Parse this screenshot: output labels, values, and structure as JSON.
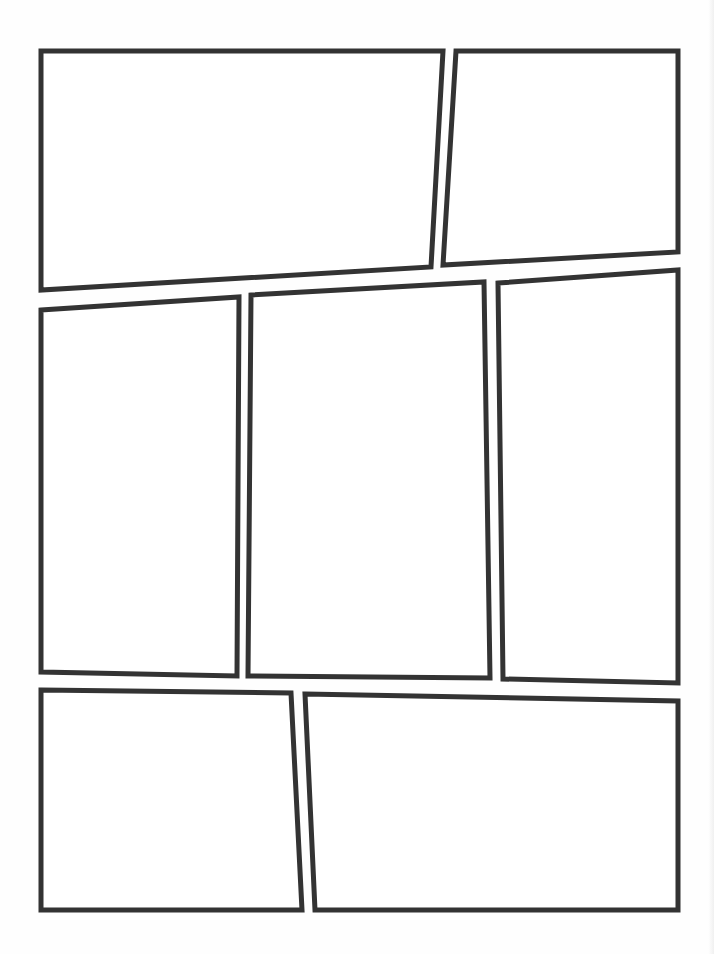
{
  "page": {
    "type": "comic-panel-layout-template",
    "background": "#ffffff",
    "border_color": "#333333",
    "border_width": 5,
    "rows": [
      {
        "row": 1,
        "panels": [
          {
            "id": "panel-1",
            "points": [
              [
                41,
                51
              ],
              [
                443,
                51
              ],
              [
                431,
                267
              ],
              [
                41,
                290
              ]
            ]
          },
          {
            "id": "panel-2",
            "points": [
              [
                456,
                51
              ],
              [
                678,
                51
              ],
              [
                678,
                252
              ],
              [
                443,
                265
              ]
            ]
          }
        ]
      },
      {
        "row": 2,
        "panels": [
          {
            "id": "panel-3",
            "points": [
              [
                41,
                310
              ],
              [
                239,
                297
              ],
              [
                237,
                676
              ],
              [
                41,
                672
              ]
            ]
          },
          {
            "id": "panel-4",
            "points": [
              [
                251,
                295
              ],
              [
                484,
                282
              ],
              [
                490,
                678
              ],
              [
                248,
                676
              ]
            ]
          },
          {
            "id": "panel-5",
            "points": [
              [
                498,
                283
              ],
              [
                678,
                270
              ],
              [
                678,
                683
              ],
              [
                503,
                679
              ]
            ]
          }
        ]
      },
      {
        "row": 3,
        "panels": [
          {
            "id": "panel-6",
            "points": [
              [
                41,
                690
              ],
              [
                291,
                693
              ],
              [
                302,
                910
              ],
              [
                41,
                910
              ]
            ]
          },
          {
            "id": "panel-7",
            "points": [
              [
                305,
                694
              ],
              [
                678,
                701
              ],
              [
                678,
                910
              ],
              [
                315,
                910
              ]
            ]
          }
        ]
      }
    ]
  }
}
